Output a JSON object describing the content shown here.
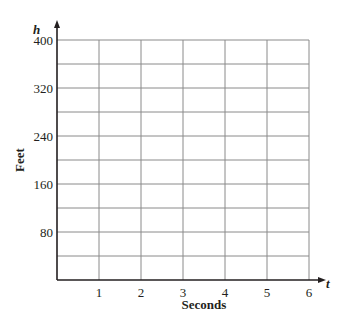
{
  "chart_data": {
    "type": "line",
    "title": "",
    "xlabel": "Seconds",
    "ylabel": "Feet",
    "x_axis_variable": "t",
    "y_axis_variable": "h",
    "x_ticks": [
      1,
      2,
      3,
      4,
      5,
      6
    ],
    "y_ticks": [
      80,
      160,
      240,
      320,
      400
    ],
    "xlim": [
      0,
      6
    ],
    "ylim": [
      0,
      400
    ],
    "x_grid_step": 1,
    "y_grid_step": 40,
    "grid": true,
    "series": [],
    "legend": null
  },
  "style": {
    "grid_color": "#8a8a8a",
    "axis_color": "#231f20",
    "text_color": "#231f20"
  }
}
